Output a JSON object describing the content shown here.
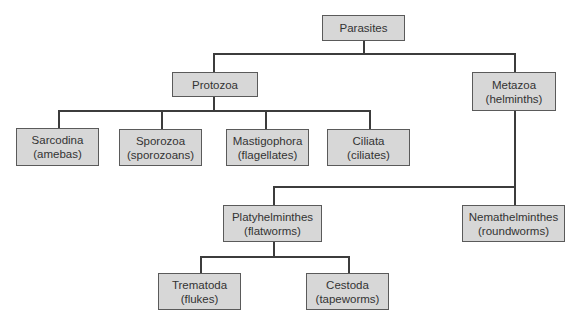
{
  "diagram": {
    "type": "taxonomy-tree",
    "root": "parasites",
    "colors": {
      "node_fill": "#d7d7d7",
      "node_border": "#5a5a5a",
      "text": "#333333",
      "connector": "#3c3c3c"
    },
    "nodes": {
      "parasites": {
        "line1": "Parasites",
        "line2": ""
      },
      "protozoa": {
        "line1": "Protozoa",
        "line2": ""
      },
      "metazoa": {
        "line1": "Metazoa",
        "line2": "(helminths)"
      },
      "sarcodina": {
        "line1": "Sarcodina",
        "line2": "(amebas)"
      },
      "sporozoa": {
        "line1": "Sporozoa",
        "line2": "(sporozoans)"
      },
      "mastigophora": {
        "line1": "Mastigophora",
        "line2": "(flagellates)"
      },
      "ciliata": {
        "line1": "Ciliata",
        "line2": "(ciliates)"
      },
      "platyhelminthes": {
        "line1": "Platyhelminthes",
        "line2": "(flatworms)"
      },
      "nemathelminthes": {
        "line1": "Nemathelminthes",
        "line2": "(roundworms)"
      },
      "trematoda": {
        "line1": "Trematoda",
        "line2": "(flukes)"
      },
      "cestoda": {
        "line1": "Cestoda",
        "line2": "(tapeworms)"
      }
    },
    "edges": [
      [
        "parasites",
        "protozoa"
      ],
      [
        "parasites",
        "metazoa"
      ],
      [
        "protozoa",
        "sarcodina"
      ],
      [
        "protozoa",
        "sporozoa"
      ],
      [
        "protozoa",
        "mastigophora"
      ],
      [
        "protozoa",
        "ciliata"
      ],
      [
        "metazoa",
        "platyhelminthes"
      ],
      [
        "metazoa",
        "nemathelminthes"
      ],
      [
        "platyhelminthes",
        "trematoda"
      ],
      [
        "platyhelminthes",
        "cestoda"
      ]
    ]
  }
}
